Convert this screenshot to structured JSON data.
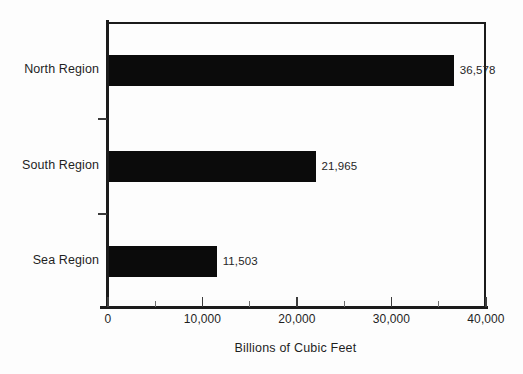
{
  "chart_data": {
    "type": "bar",
    "orientation": "horizontal",
    "title": "",
    "subtitle": "",
    "categories": [
      "North Region",
      "South Region",
      "Sea Region"
    ],
    "values": [
      36578,
      21965,
      11503
    ],
    "value_labels": [
      "36,578",
      "21,965",
      "11,503"
    ],
    "xlabel": "Billions of Cubic Feet",
    "ylabel": "",
    "xlim": [
      0,
      40000
    ],
    "xticks": [
      0,
      10000,
      20000,
      30000,
      40000
    ],
    "xtick_labels": [
      "0",
      "10,000",
      "20,000",
      "30,000",
      "40,000"
    ],
    "minor_xticks": [
      5000,
      15000,
      25000,
      35000
    ],
    "grid": false,
    "legend": null,
    "legend_position": "none",
    "series": [
      {
        "name": "Billions of Cubic Feet",
        "values": [
          36578,
          21965,
          11503
        ]
      }
    ],
    "colors": {
      "bar": "#0b0b0b",
      "axis": "#1b1b1b",
      "text": "#1f1f1f",
      "background": "#fdfdfd"
    }
  },
  "axis": {
    "x_title": "Billions of Cubic Feet",
    "tick_labels": [
      "0",
      "10,000",
      "20,000",
      "30,000",
      "40,000"
    ]
  },
  "categories": {
    "north": "North Region",
    "south": "South Region",
    "sea": "Sea Region"
  },
  "values": {
    "north": "36,578",
    "south": "21,965",
    "sea": "11,503"
  }
}
